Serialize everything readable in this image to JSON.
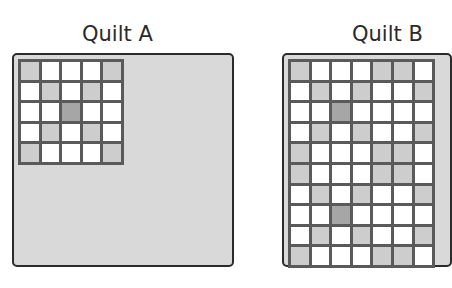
{
  "quilt_a": {
    "title": "Quilt A",
    "rows": [
      [
        "L",
        "W",
        "W",
        "W",
        "L"
      ],
      [
        "W",
        "L",
        "W",
        "L",
        "W"
      ],
      [
        "W",
        "W",
        "D",
        "W",
        "W"
      ],
      [
        "W",
        "L",
        "W",
        "L",
        "W"
      ],
      [
        "L",
        "W",
        "W",
        "W",
        "L"
      ]
    ]
  },
  "quilt_b": {
    "title": "Quilt B",
    "rows": [
      [
        "L",
        "W",
        "W",
        "W",
        "L",
        "L",
        "W"
      ],
      [
        "W",
        "L",
        "W",
        "L",
        "W",
        "W",
        "L"
      ],
      [
        "W",
        "W",
        "D",
        "W",
        "W",
        "W",
        "W"
      ],
      [
        "W",
        "L",
        "W",
        "L",
        "W",
        "W",
        "L"
      ],
      [
        "L",
        "W",
        "W",
        "W",
        "L",
        "L",
        "W"
      ],
      [
        "L",
        "W",
        "W",
        "W",
        "L",
        "L",
        "W"
      ],
      [
        "W",
        "L",
        "W",
        "L",
        "W",
        "W",
        "L"
      ],
      [
        "W",
        "W",
        "D",
        "W",
        "W",
        "W",
        "W"
      ],
      [
        "W",
        "L",
        "W",
        "L",
        "W",
        "W",
        "L"
      ],
      [
        "L",
        "W",
        "W",
        "W",
        "L",
        "L",
        "W"
      ]
    ]
  },
  "colors": {
    "background": "#d9d9d9",
    "light_cell": "#cdcdcd",
    "dark_cell": "#a6a6a6",
    "white_cell": "#ffffff",
    "grid_line": "#5a5a5a",
    "border": "#2b2b2b"
  }
}
